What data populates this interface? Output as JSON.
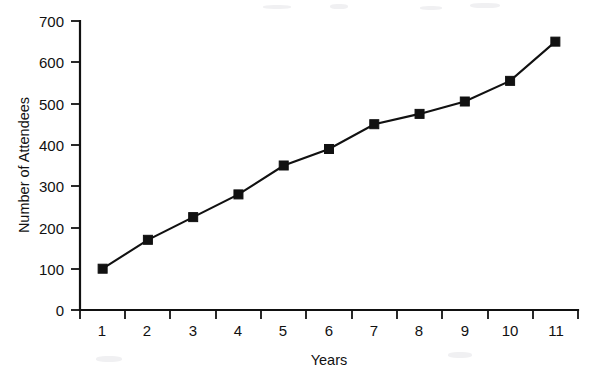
{
  "chart_data": {
    "type": "line",
    "title": "",
    "subtitle": "",
    "xlabel": "Years",
    "ylabel": "Number of Attendees",
    "x": [
      1,
      2,
      3,
      4,
      5,
      6,
      7,
      8,
      9,
      10,
      11
    ],
    "categories": [
      "1",
      "2",
      "3",
      "4",
      "5",
      "6",
      "7",
      "8",
      "9",
      "10",
      "11"
    ],
    "values": [
      100,
      170,
      225,
      280,
      350,
      390,
      450,
      475,
      505,
      555,
      650
    ],
    "series": [
      {
        "name": "Number of Attendees",
        "values": [
          100,
          170,
          225,
          280,
          350,
          390,
          450,
          475,
          505,
          555,
          650
        ]
      }
    ],
    "xlim": [
      0.5,
      11.5
    ],
    "ylim": [
      0,
      700
    ],
    "y_ticks": [
      0,
      100,
      200,
      300,
      400,
      500,
      600,
      700
    ],
    "y_tick_labels": [
      "0",
      "100",
      "200",
      "300",
      "400",
      "500",
      "600",
      "700"
    ],
    "x_tick_labels": [
      "1",
      "2",
      "3",
      "4",
      "5",
      "6",
      "7",
      "8",
      "9",
      "10",
      "11"
    ],
    "grid": false,
    "legend": false,
    "legend_position": "none",
    "marker": "square",
    "line_color": "#111111",
    "marker_color": "#111111",
    "background_color": "#ffffff"
  },
  "axes": {
    "y_title": "Number of Attendees",
    "x_title": "Years"
  }
}
